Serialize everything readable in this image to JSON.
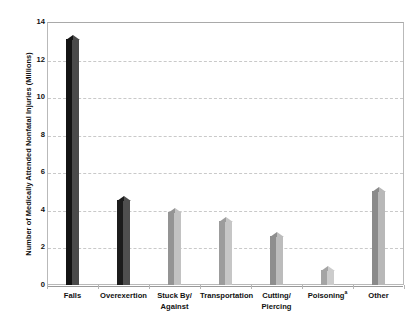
{
  "chart_data": {
    "type": "bar",
    "title": "",
    "subtitle": "",
    "xlabel": "",
    "ylabel": "Number of Medically Attended Nonfatal Injuries (Millions)",
    "ylim": [
      0,
      14
    ],
    "ytick_values": [
      0,
      2,
      4,
      6,
      8,
      10,
      12,
      14
    ],
    "ytick_labels": [
      "0",
      "2",
      "4",
      "6",
      "8",
      "10",
      "12",
      "14"
    ],
    "grid": "horizontal-dashed",
    "legend": "none",
    "categories": [
      "Falls",
      "Overexertion",
      "Stuck By/ Against",
      "Transportation",
      "Cutting/ Piercing",
      "Poisoning",
      "Other"
    ],
    "category_lines": [
      [
        "Falls"
      ],
      [
        "Overexertion"
      ],
      [
        "Stuck By/",
        "Against"
      ],
      [
        "Transportation"
      ],
      [
        "Cutting/",
        "Piercing"
      ],
      [
        "Poisoning"
      ],
      [
        "Other"
      ]
    ],
    "category_footnote_markers": [
      "",
      "",
      "",
      "",
      "",
      "a",
      ""
    ],
    "values": [
      13.1,
      4.5,
      3.9,
      3.4,
      2.6,
      0.8,
      5.0
    ],
    "bar_colors": [
      "#141414",
      "#1c1c1c",
      "#949494",
      "#9c9c9c",
      "#8e8e8e",
      "#a4a4a4",
      "#8a8a8a"
    ],
    "bar_shade_colors": [
      "#4a4a4a",
      "#4f4f4f",
      "#c2c2c2",
      "#c6c6c6",
      "#bcbcbc",
      "#cccccc",
      "#b8b8b8"
    ],
    "frame_color": "#b9b9b9",
    "gridline_color": "#c9c9c9",
    "axis_color": "#8f8f8f",
    "background_color": "#ffffff",
    "text_color": "#111111"
  }
}
